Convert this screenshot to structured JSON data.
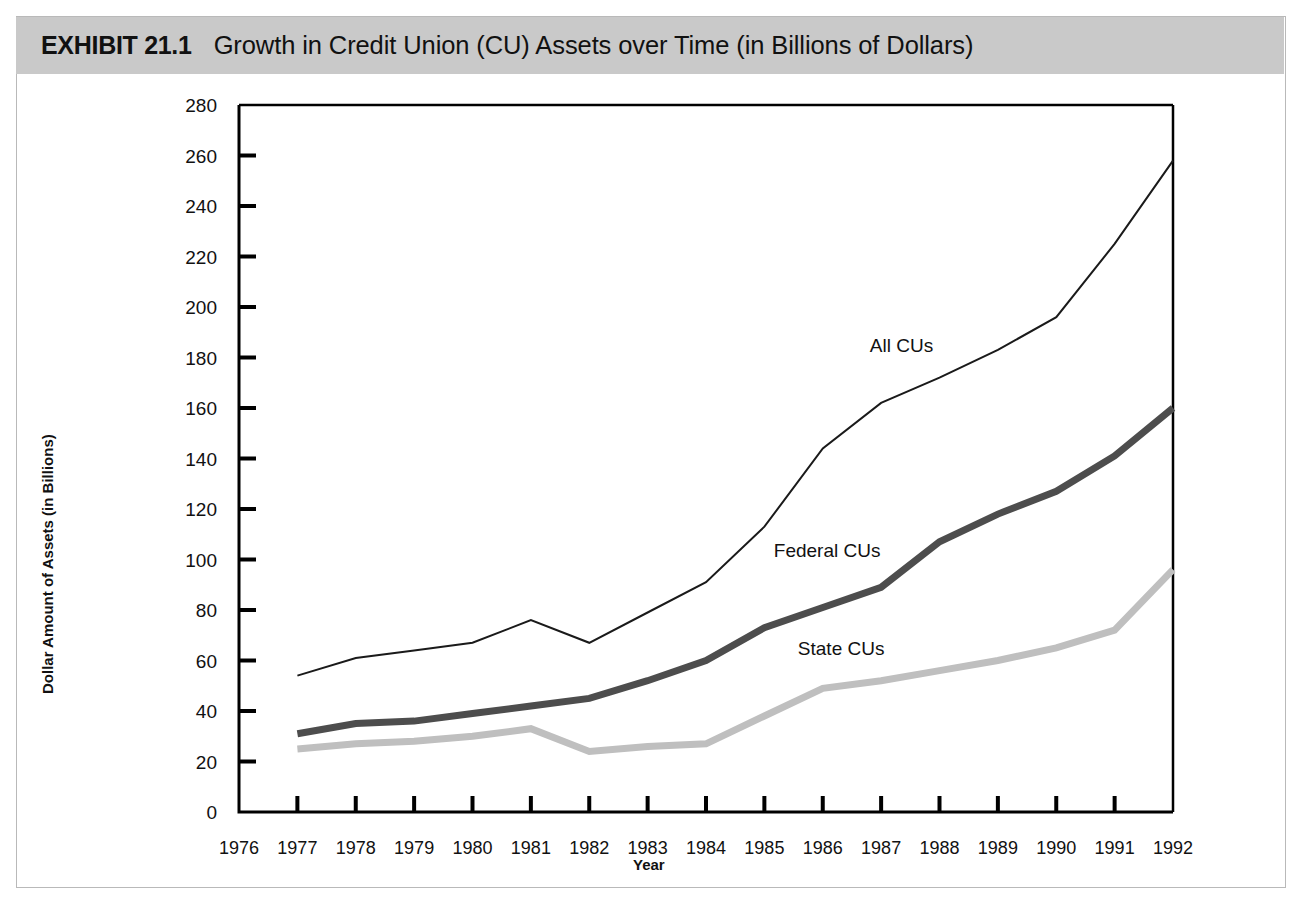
{
  "exhibit": {
    "number": "EXHIBIT 21.1",
    "title": "Growth in Credit Union (CU) Assets over Time (in Billions of Dollars)"
  },
  "axis": {
    "y_title": "Dollar Amount of Assets (in Billions)",
    "x_title": "Year"
  },
  "colors": {
    "banner": "#c9c9c9",
    "all_cus": "#1a1a1a",
    "federal_cus": "#4d4d4d",
    "state_cus": "#bfbfbf",
    "frame": "#b9b9b9",
    "axis": "#000000"
  },
  "chart_data": {
    "type": "line",
    "title": "Growth in Credit Union (CU) Assets over Time (in Billions of Dollars)",
    "xlabel": "Year",
    "ylabel": "Dollar Amount of Assets (in Billions)",
    "x": [
      1976,
      1977,
      1978,
      1979,
      1980,
      1981,
      1982,
      1983,
      1984,
      1985,
      1986,
      1987,
      1988,
      1989,
      1990,
      1991,
      1992
    ],
    "xtick_labels": [
      "1976",
      "1977",
      "1978",
      "1979",
      "1980",
      "1981",
      "1982",
      "1983",
      "1984",
      "1985",
      "1986",
      "1987",
      "1988",
      "1989",
      "1990",
      "1991",
      "1992"
    ],
    "xlim": [
      1976,
      1992
    ],
    "ylim": [
      0,
      280
    ],
    "ytick_labels": [
      "0",
      "20",
      "40",
      "60",
      "80",
      "100",
      "120",
      "140",
      "160",
      "180",
      "200",
      "220",
      "240",
      "260",
      "280"
    ],
    "ytick_values": [
      0,
      20,
      40,
      60,
      80,
      100,
      120,
      140,
      160,
      180,
      200,
      220,
      240,
      260,
      280
    ],
    "grid": false,
    "legend": "inline-annotations",
    "series": [
      {
        "name": "All CUs",
        "color": "#1a1a1a",
        "line_width": 2,
        "x": [
          1977,
          1978,
          1979,
          1980,
          1981,
          1982,
          1983,
          1984,
          1985,
          1986,
          1987,
          1988,
          1989,
          1990,
          1991,
          1992
        ],
        "values": [
          54,
          61,
          64,
          67,
          76,
          67,
          79,
          91,
          113,
          144,
          162,
          172,
          183,
          196,
          225,
          258
        ],
        "label_at_year": 1988,
        "label_text": "All CUs"
      },
      {
        "name": "Federal CUs",
        "color": "#4d4d4d",
        "line_width": 7,
        "x": [
          1977,
          1978,
          1979,
          1980,
          1981,
          1982,
          1983,
          1984,
          1985,
          1986,
          1987,
          1988,
          1989,
          1990,
          1991,
          1992
        ],
        "values": [
          31,
          35,
          36,
          39,
          42,
          45,
          52,
          60,
          73,
          81,
          89,
          107,
          118,
          127,
          141,
          160
        ],
        "label_at_year": 1987,
        "label_text": "Federal CUs"
      },
      {
        "name": "State CUs",
        "color": "#bfbfbf",
        "line_width": 7,
        "x": [
          1977,
          1978,
          1979,
          1980,
          1981,
          1982,
          1983,
          1984,
          1985,
          1986,
          1987,
          1988,
          1989,
          1990,
          1991,
          1992
        ],
        "values": [
          25,
          27,
          28,
          30,
          33,
          24,
          26,
          27,
          38,
          49,
          52,
          56,
          60,
          65,
          72,
          96
        ],
        "label_at_year": 1987,
        "label_text": "State CUs"
      }
    ]
  }
}
